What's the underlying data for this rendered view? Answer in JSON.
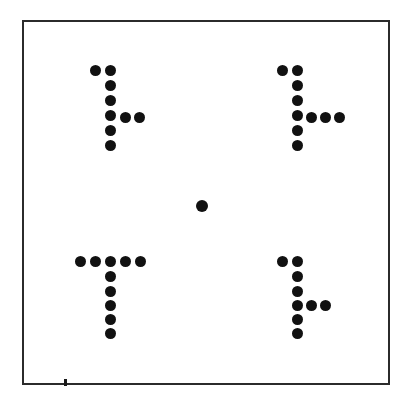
{
  "figure": {
    "background_color": "#ffffff",
    "dot_color": "#111111",
    "frame_color": "#2b2b2b",
    "canvas": {
      "width": 417,
      "height": 410
    }
  },
  "frame": {
    "name": "display-field-border",
    "x": 22,
    "y": 20,
    "width": 368,
    "height": 365,
    "stroke_width": 2
  },
  "registration_tick": {
    "label": "bottom-border-registration-tick",
    "x": 64,
    "y": 379,
    "width": 3,
    "height": 7
  },
  "fixation": {
    "label": "central-fixation-dot",
    "cx": 202,
    "cy": 206,
    "diameter": 12
  },
  "dot_metrics": {
    "diameter": 11,
    "pitch": 13
  },
  "items": [
    {
      "id": "item-top-left",
      "label": "top-left-rotated-t",
      "quadrant": "top-left",
      "orientation": "rotated-90-ccw",
      "dot_count": 9,
      "dots": [
        {
          "cx": 95,
          "cy": 70
        },
        {
          "cx": 110,
          "cy": 70
        },
        {
          "cx": 110,
          "cy": 85
        },
        {
          "cx": 110,
          "cy": 100
        },
        {
          "cx": 110,
          "cy": 115
        },
        {
          "cx": 125,
          "cy": 117
        },
        {
          "cx": 139,
          "cy": 117
        },
        {
          "cx": 110,
          "cy": 130
        },
        {
          "cx": 110,
          "cy": 145
        }
      ]
    },
    {
      "id": "item-top-right",
      "label": "top-right-rotated-t",
      "quadrant": "top-right",
      "orientation": "rotated-90-ccw",
      "dot_count": 10,
      "dots": [
        {
          "cx": 282,
          "cy": 70
        },
        {
          "cx": 297,
          "cy": 70
        },
        {
          "cx": 297,
          "cy": 85
        },
        {
          "cx": 297,
          "cy": 100
        },
        {
          "cx": 297,
          "cy": 115
        },
        {
          "cx": 311,
          "cy": 117
        },
        {
          "cx": 325,
          "cy": 117
        },
        {
          "cx": 339,
          "cy": 117
        },
        {
          "cx": 297,
          "cy": 130
        },
        {
          "cx": 297,
          "cy": 145
        }
      ]
    },
    {
      "id": "item-bottom-left",
      "label": "bottom-left-upright-t",
      "quadrant": "bottom-left",
      "orientation": "upright",
      "dot_count": 10,
      "dots": [
        {
          "cx": 80,
          "cy": 261
        },
        {
          "cx": 95,
          "cy": 261
        },
        {
          "cx": 110,
          "cy": 261
        },
        {
          "cx": 125,
          "cy": 261
        },
        {
          "cx": 140,
          "cy": 261
        },
        {
          "cx": 110,
          "cy": 276
        },
        {
          "cx": 110,
          "cy": 291
        },
        {
          "cx": 110,
          "cy": 305
        },
        {
          "cx": 110,
          "cy": 319
        },
        {
          "cx": 110,
          "cy": 333
        }
      ]
    },
    {
      "id": "item-bottom-right",
      "label": "bottom-right-rotated-t",
      "quadrant": "bottom-right",
      "orientation": "rotated-90-ccw",
      "dot_count": 9,
      "dots": [
        {
          "cx": 282,
          "cy": 261
        },
        {
          "cx": 297,
          "cy": 261
        },
        {
          "cx": 297,
          "cy": 276
        },
        {
          "cx": 297,
          "cy": 291
        },
        {
          "cx": 297,
          "cy": 305
        },
        {
          "cx": 311,
          "cy": 305
        },
        {
          "cx": 325,
          "cy": 305
        },
        {
          "cx": 297,
          "cy": 319
        },
        {
          "cx": 297,
          "cy": 333
        }
      ]
    }
  ]
}
